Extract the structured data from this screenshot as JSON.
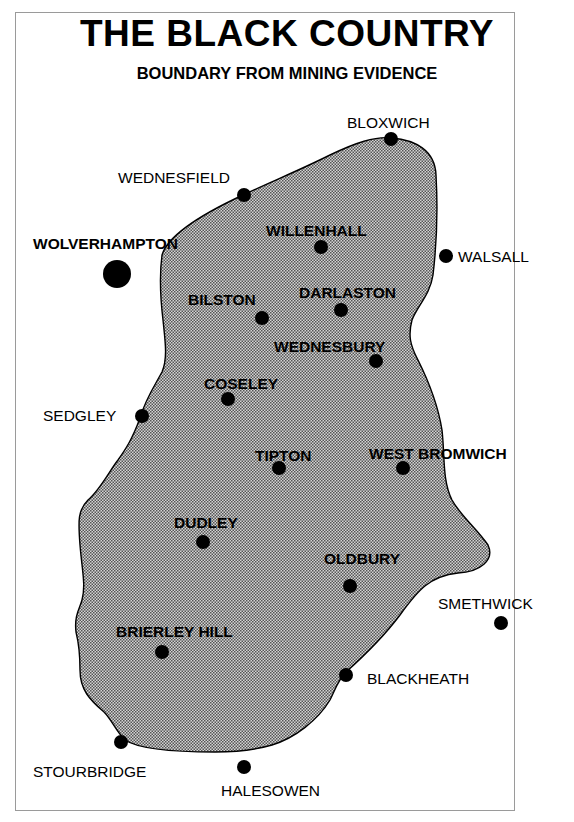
{
  "header": {
    "title": "THE BLACK COUNTRY",
    "subtitle": "BOUNDARY FROM MINING EVIDENCE"
  },
  "map": {
    "fill_color": "#b8b8b8",
    "outline_color": "#000000",
    "dot_color": "#000000",
    "towns": [
      {
        "name": "BLOXWICH",
        "label": "BLOXWICH",
        "position": "boundary"
      },
      {
        "name": "WEDNESFIELD",
        "label": "WEDNESFIELD",
        "position": "boundary"
      },
      {
        "name": "WOLVERHAMPTON",
        "label": "WOLVERHAMPTON",
        "position": "outside"
      },
      {
        "name": "WILLENHALL",
        "label": "WILLENHALL",
        "position": "inside"
      },
      {
        "name": "WALSALL",
        "label": "WALSALL",
        "position": "outside"
      },
      {
        "name": "BILSTON",
        "label": "BILSTON",
        "position": "inside"
      },
      {
        "name": "DARLASTON",
        "label": "DARLASTON",
        "position": "inside"
      },
      {
        "name": "WEDNESBURY",
        "label": "WEDNESBURY",
        "position": "inside"
      },
      {
        "name": "COSELEY",
        "label": "COSELEY",
        "position": "inside"
      },
      {
        "name": "SEDGLEY",
        "label": "SEDGLEY",
        "position": "boundary"
      },
      {
        "name": "TIPTON",
        "label": "TIPTON",
        "position": "inside"
      },
      {
        "name": "WEST BROMWICH",
        "label": "WEST BROMWICH",
        "position": "inside"
      },
      {
        "name": "DUDLEY",
        "label": "DUDLEY",
        "position": "inside"
      },
      {
        "name": "OLDBURY",
        "label": "OLDBURY",
        "position": "inside"
      },
      {
        "name": "SMETHWICK",
        "label": "SMETHWICK",
        "position": "outside"
      },
      {
        "name": "BRIERLEY HILL",
        "label": "BRIERLEY HILL",
        "position": "inside"
      },
      {
        "name": "BLACKHEATH",
        "label": "BLACKHEATH",
        "position": "boundary"
      },
      {
        "name": "STOURBRIDGE",
        "label": "STOURBRIDGE",
        "position": "boundary"
      },
      {
        "name": "HALESOWEN",
        "label": "HALESOWEN",
        "position": "boundary"
      }
    ]
  }
}
